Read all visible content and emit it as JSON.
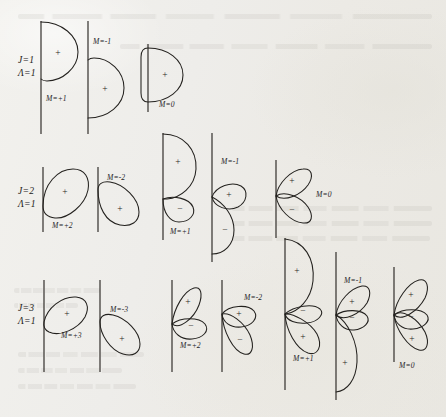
{
  "figure": {
    "background_color": "#efeeea",
    "ink_color": "#23211e",
    "type": "physics-lobe-diagram"
  },
  "rows": [
    {
      "id": "row-j1",
      "label_line1": "J=1",
      "label_line2": "Λ=1",
      "J": 1,
      "Lambda": 1,
      "panels": [
        {
          "id": "j1-m-plus1",
          "m_label": "M=+1",
          "lobes": [
            "+"
          ]
        },
        {
          "id": "j1-m-minus1",
          "m_label": "M=-1",
          "lobes": [
            "+"
          ]
        },
        {
          "id": "j1-m-0",
          "m_label": "M=0",
          "lobes": [
            "+"
          ]
        }
      ]
    },
    {
      "id": "row-j2",
      "label_line1": "J=2",
      "label_line2": "Λ=1",
      "J": 2,
      "Lambda": 1,
      "panels": [
        {
          "id": "j2-m-plus2",
          "m_label": "M=+2",
          "lobes": [
            "+"
          ]
        },
        {
          "id": "j2-m-minus2",
          "m_label": "M=-2",
          "lobes": [
            "+"
          ]
        },
        {
          "id": "j2-m-plus1",
          "m_label": "M=+1",
          "lobes": [
            "+",
            "-"
          ]
        },
        {
          "id": "j2-m-minus1",
          "m_label": "M=-1",
          "lobes": [
            "+",
            "-"
          ]
        },
        {
          "id": "j2-m-0",
          "m_label": "M=0",
          "lobes": [
            "+",
            "-"
          ]
        }
      ]
    },
    {
      "id": "row-j3",
      "label_line1": "J=3",
      "label_line2": "Λ=1",
      "J": 3,
      "Lambda": 1,
      "panels": [
        {
          "id": "j3-m-plus3",
          "m_label": "M=+3",
          "lobes": [
            "+"
          ]
        },
        {
          "id": "j3-m-minus3",
          "m_label": "M=-3",
          "lobes": [
            "+"
          ]
        },
        {
          "id": "j3-m-plus2",
          "m_label": "M=+2",
          "lobes": [
            "+",
            "-"
          ]
        },
        {
          "id": "j3-m-minus2",
          "m_label": "M=-2",
          "lobes": [
            "+",
            "-"
          ]
        },
        {
          "id": "j3-m-plus1",
          "m_label": "M=+1",
          "lobes": [
            "+",
            "-",
            "+"
          ]
        },
        {
          "id": "j3-m-minus1",
          "m_label": "M=-1",
          "lobes": [
            "+",
            "-",
            "+"
          ]
        },
        {
          "id": "j3-m-0",
          "m_label": "M=0",
          "lobes": [
            "+",
            "-",
            "+"
          ]
        }
      ]
    }
  ],
  "signs": {
    "positive": "+",
    "negative": "−"
  }
}
